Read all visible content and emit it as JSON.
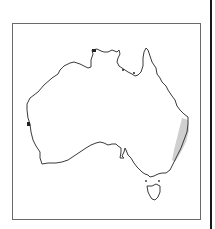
{
  "map": {
    "subject": "Australia distribution map",
    "region_shaded": "east coast (New South Wales / southern Queensland)",
    "colors": {
      "outline": "#3a3a3a",
      "shaded": "#cfcfcf",
      "frame": "#6a6a6a",
      "side_rule": "#1a1a1a",
      "background": "#ffffff"
    },
    "features": [
      {
        "name": "mainland-outline"
      },
      {
        "name": "tasmania-outline"
      },
      {
        "name": "distribution-range-east-coast"
      }
    ]
  }
}
